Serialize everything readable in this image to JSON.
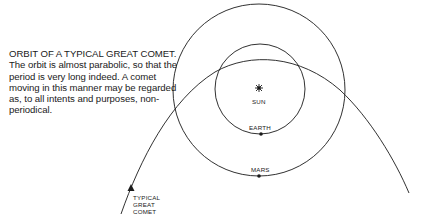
{
  "caption": {
    "title": "ORBIT OF A TYPICAL GREAT COMET.",
    "body": "The orbit is almost parabolic, so that the period is very long indeed. A comet moving in this manner may be regarded as, to all intents and purposes, non-periodical."
  },
  "labels": {
    "sun": "SUN",
    "earth": "EARTH",
    "mars": "MARS",
    "comet_line1": "TYPICAL",
    "comet_line2": "GREAT",
    "comet_line3": "COMET"
  },
  "icons": {
    "sun": "sun-star-icon",
    "direction": "arrow-icon"
  },
  "colors": {
    "ink": "#1a1a1a",
    "background": "#ffffff"
  }
}
